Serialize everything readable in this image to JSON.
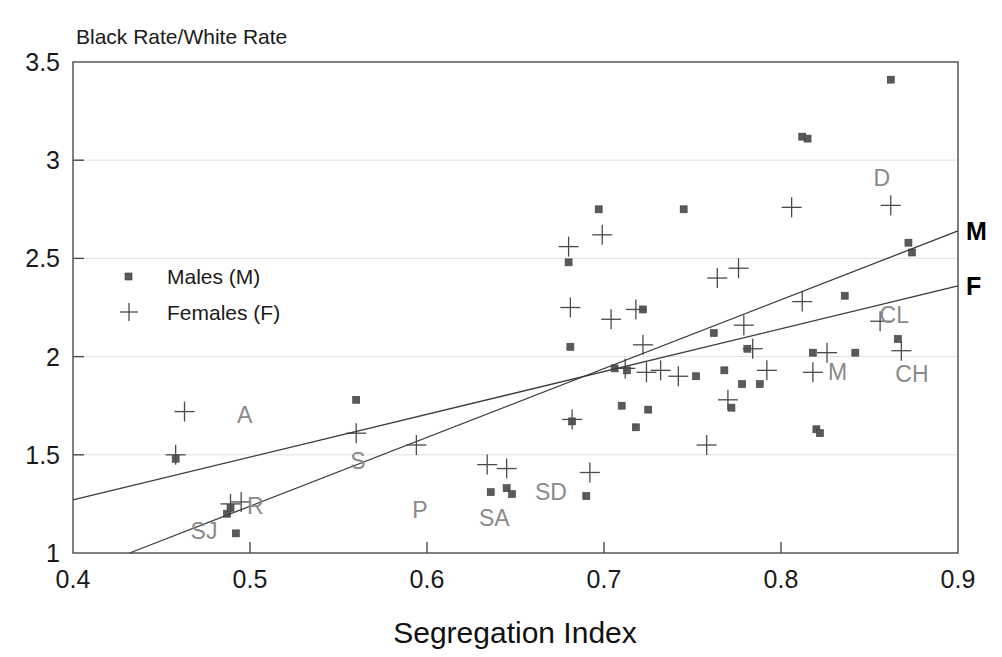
{
  "chart_data": {
    "type": "scatter",
    "title": "Black Rate/White Rate",
    "xlabel": "Segregation Index",
    "ylabel": "Black Rate/White Rate",
    "xlim": [
      0.4,
      0.9
    ],
    "ylim": [
      1,
      3.5
    ],
    "xticks": [
      0.4,
      0.5,
      0.6,
      0.7,
      0.8,
      0.9
    ],
    "xticklabels": [
      "0.4",
      "0.5",
      "0.6",
      "0.7",
      "0.8",
      "0.9"
    ],
    "yticks": [
      1,
      1.5,
      2,
      2.5,
      3,
      3.5
    ],
    "yticklabels": [
      "1",
      "1.5",
      "2",
      "2.5",
      "3",
      "3.5"
    ],
    "grid": true,
    "legend_position": "left-middle",
    "series": [
      {
        "name": "Males (M)",
        "marker": "square",
        "points": [
          [
            0.458,
            1.48
          ],
          [
            0.487,
            1.2
          ],
          [
            0.489,
            1.23
          ],
          [
            0.492,
            1.1
          ],
          [
            0.56,
            1.78
          ],
          [
            0.636,
            1.31
          ],
          [
            0.645,
            1.33
          ],
          [
            0.648,
            1.3
          ],
          [
            0.68,
            2.48
          ],
          [
            0.681,
            2.05
          ],
          [
            0.682,
            1.67
          ],
          [
            0.69,
            1.29
          ],
          [
            0.697,
            2.75
          ],
          [
            0.706,
            1.94
          ],
          [
            0.71,
            1.75
          ],
          [
            0.713,
            1.93
          ],
          [
            0.718,
            1.64
          ],
          [
            0.722,
            2.24
          ],
          [
            0.725,
            1.73
          ],
          [
            0.745,
            2.75
          ],
          [
            0.752,
            1.9
          ],
          [
            0.762,
            2.12
          ],
          [
            0.768,
            1.93
          ],
          [
            0.772,
            1.74
          ],
          [
            0.778,
            1.86
          ],
          [
            0.781,
            2.04
          ],
          [
            0.788,
            1.86
          ],
          [
            0.812,
            3.12
          ],
          [
            0.815,
            3.11
          ],
          [
            0.818,
            2.02
          ],
          [
            0.82,
            1.63
          ],
          [
            0.822,
            1.61
          ],
          [
            0.836,
            2.31
          ],
          [
            0.842,
            2.02
          ],
          [
            0.862,
            3.41
          ],
          [
            0.866,
            2.09
          ],
          [
            0.872,
            2.58
          ],
          [
            0.874,
            2.53
          ]
        ]
      },
      {
        "name": "Females (F)",
        "marker": "plus",
        "points": [
          [
            0.458,
            1.5
          ],
          [
            0.463,
            1.72
          ],
          [
            0.489,
            1.25
          ],
          [
            0.495,
            1.26
          ],
          [
            0.56,
            1.61
          ],
          [
            0.594,
            1.55
          ],
          [
            0.634,
            1.45
          ],
          [
            0.645,
            1.43
          ],
          [
            0.692,
            1.41
          ],
          [
            0.68,
            2.56
          ],
          [
            0.681,
            2.25
          ],
          [
            0.682,
            1.68
          ],
          [
            0.699,
            2.62
          ],
          [
            0.704,
            2.19
          ],
          [
            0.712,
            1.94
          ],
          [
            0.718,
            2.24
          ],
          [
            0.722,
            2.06
          ],
          [
            0.724,
            1.92
          ],
          [
            0.732,
            1.93
          ],
          [
            0.742,
            1.9
          ],
          [
            0.758,
            1.55
          ],
          [
            0.764,
            2.4
          ],
          [
            0.77,
            1.78
          ],
          [
            0.776,
            2.45
          ],
          [
            0.779,
            2.16
          ],
          [
            0.784,
            2.04
          ],
          [
            0.792,
            1.93
          ],
          [
            0.806,
            2.76
          ],
          [
            0.812,
            2.28
          ],
          [
            0.818,
            1.92
          ],
          [
            0.826,
            2.02
          ],
          [
            0.856,
            2.18
          ],
          [
            0.862,
            2.77
          ],
          [
            0.868,
            2.03
          ]
        ]
      }
    ],
    "fit_lines": [
      {
        "name": "M",
        "label": "M",
        "x0": 0.432,
        "y0": 1.0,
        "x1": 0.9,
        "y1": 2.64
      },
      {
        "name": "F",
        "label": "F",
        "x0": 0.4,
        "y0": 1.27,
        "x1": 0.9,
        "y1": 2.36
      }
    ],
    "annotations": [
      {
        "label": "A",
        "x": 0.497,
        "y": 1.66
      },
      {
        "label": "S",
        "x": 0.561,
        "y": 1.43
      },
      {
        "label": "R",
        "x": 0.503,
        "y": 1.2
      },
      {
        "label": "SJ",
        "x": 0.474,
        "y": 1.07
      },
      {
        "label": "P",
        "x": 0.596,
        "y": 1.18
      },
      {
        "label": "SA",
        "x": 0.638,
        "y": 1.14
      },
      {
        "label": "SD",
        "x": 0.67,
        "y": 1.27
      },
      {
        "label": "D",
        "x": 0.857,
        "y": 2.87
      },
      {
        "label": "CL",
        "x": 0.864,
        "y": 2.17
      },
      {
        "label": "M",
        "x": 0.832,
        "y": 1.88
      },
      {
        "label": "CH",
        "x": 0.874,
        "y": 1.87
      }
    ]
  },
  "legend": {
    "items": [
      {
        "label": "Males (M)",
        "marker": "square"
      },
      {
        "label": "Females (F)",
        "marker": "plus"
      }
    ]
  }
}
